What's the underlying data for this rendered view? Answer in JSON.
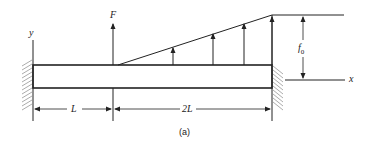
{
  "diagram": {
    "caption": "(a)",
    "labels": {
      "y_axis": "y",
      "x_axis": "x",
      "force": "F",
      "distributed_max": "f",
      "distributed_max_sub": "0",
      "span_left": "L",
      "span_right": "2L"
    },
    "colors": {
      "line": "#222222",
      "hatch": "#888888",
      "background": "#ffffff"
    }
  }
}
